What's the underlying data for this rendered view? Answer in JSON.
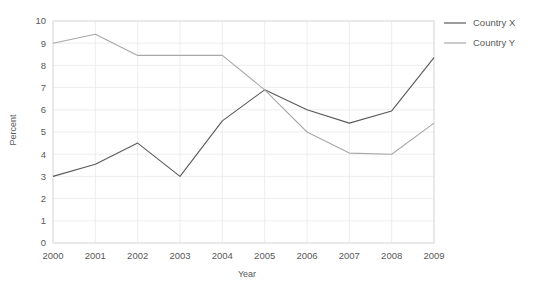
{
  "chart_data": {
    "type": "line",
    "title": "",
    "xlabel": "Year",
    "ylabel": "Percent",
    "categories": [
      "2000",
      "2001",
      "2002",
      "2003",
      "2004",
      "2005",
      "2006",
      "2007",
      "2008",
      "2009"
    ],
    "x": [
      2000,
      2001,
      2002,
      2003,
      2004,
      2005,
      2006,
      2007,
      2008,
      2009
    ],
    "xlim": [
      2000,
      2009
    ],
    "ylim": [
      0,
      10
    ],
    "yticks": [
      "0",
      "1",
      "2",
      "3",
      "4",
      "5",
      "6",
      "7",
      "8",
      "9",
      "10"
    ],
    "ytick_values": [
      0,
      1,
      2,
      3,
      4,
      5,
      6,
      7,
      8,
      9,
      10
    ],
    "grid": "horizontal-and-vertical",
    "legend_position": "right",
    "series": [
      {
        "name": "Country X",
        "color": "#5a5a5a",
        "values": [
          3.0,
          3.55,
          4.5,
          3.0,
          5.5,
          6.9,
          6.0,
          5.4,
          5.95,
          8.35
        ]
      },
      {
        "name": "Country Y",
        "color": "#a8a8a8",
        "values": [
          9.0,
          9.4,
          8.45,
          8.45,
          8.45,
          6.9,
          5.0,
          4.05,
          4.0,
          5.4
        ]
      }
    ]
  },
  "colors": {
    "series_x": "#5a5a5a",
    "series_y": "#a8a8a8",
    "grid": "#e8e8e8",
    "text": "#595959",
    "background": "#ffffff"
  }
}
